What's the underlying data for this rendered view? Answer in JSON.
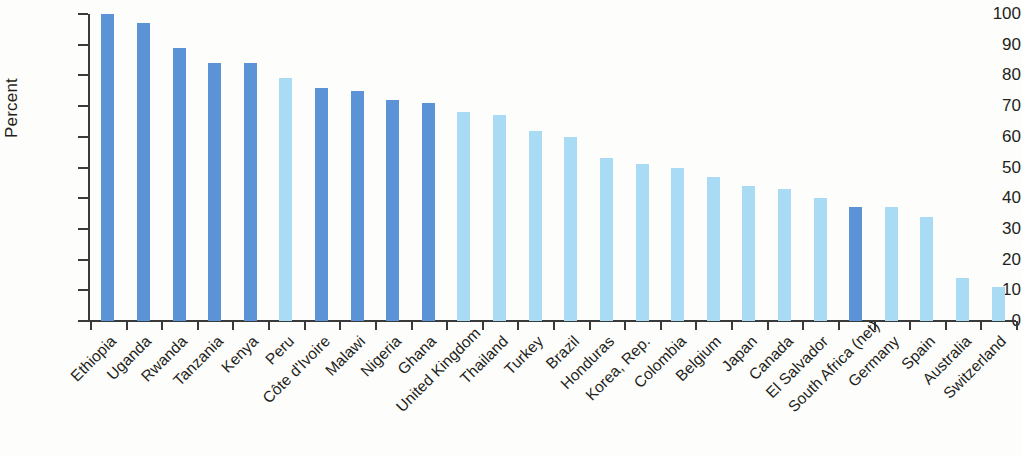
{
  "chart_data": {
    "type": "bar",
    "title": "",
    "xlabel": "",
    "ylabel": "Percent",
    "ylim": [
      0,
      100
    ],
    "ytick_step": 10,
    "yticks": [
      0,
      10,
      20,
      30,
      40,
      50,
      60,
      70,
      80,
      90,
      100
    ],
    "grid": false,
    "legend": null,
    "categories": [
      "Ethiopia",
      "Uganda",
      "Rwanda",
      "Tanzania",
      "Kenya",
      "Peru",
      "Côte d'Ivoire",
      "Malawi",
      "Nigeria",
      "Ghana",
      "United Kingdom",
      "Thailand",
      "Turkey",
      "Brazil",
      "Honduras",
      "Korea, Rep.",
      "Colombia",
      "Belgium",
      "Japan",
      "Canada",
      "El Salvador",
      "South Africa (net)",
      "Germany",
      "Spain",
      "Australia",
      "Switzerland"
    ],
    "values": [
      100,
      97,
      89,
      84,
      84,
      79,
      76,
      75,
      72,
      71,
      68,
      67,
      62,
      60,
      53,
      51,
      50,
      47,
      44,
      43,
      40,
      37,
      37,
      34,
      14,
      11
    ],
    "bar_colors": [
      "dark",
      "dark",
      "dark",
      "dark",
      "dark",
      "light",
      "dark",
      "dark",
      "dark",
      "dark",
      "light",
      "light",
      "light",
      "light",
      "light",
      "light",
      "light",
      "light",
      "light",
      "light",
      "light",
      "dark",
      "light",
      "light",
      "light",
      "light"
    ]
  },
  "colors": {
    "dark": "#5b93d6",
    "light": "#a9dbf4",
    "axis": "#3a3a3a",
    "text": "#231f20",
    "background": "#fdfdfb"
  }
}
